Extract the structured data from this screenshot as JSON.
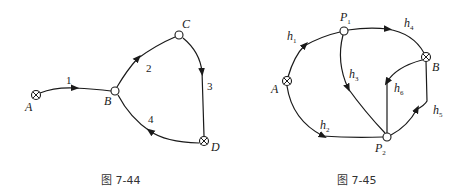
{
  "figures": [
    {
      "caption": "图 7-44",
      "nodes": [
        {
          "id": "A",
          "label": "A",
          "type": "source-sink"
        },
        {
          "id": "B",
          "label": "B",
          "type": "junction"
        },
        {
          "id": "C",
          "label": "C",
          "type": "junction"
        },
        {
          "id": "D",
          "label": "D",
          "type": "source-sink"
        }
      ],
      "edges": [
        {
          "label": "1",
          "from": "A",
          "to": "B"
        },
        {
          "label": "2",
          "from": "B",
          "to": "C"
        },
        {
          "label": "3",
          "from": "C",
          "to": "D"
        },
        {
          "label": "4",
          "from": "D",
          "to": "B"
        }
      ]
    },
    {
      "caption": "图 7-45",
      "nodes": [
        {
          "id": "A",
          "label": "A",
          "type": "source-sink"
        },
        {
          "id": "P1",
          "label": "P",
          "sub": "1",
          "type": "junction"
        },
        {
          "id": "B",
          "label": "B",
          "type": "source-sink"
        },
        {
          "id": "P2",
          "label": "P",
          "sub": "2",
          "type": "junction"
        }
      ],
      "edges": [
        {
          "label": "h",
          "sub": "1",
          "from": "A",
          "to": "P1"
        },
        {
          "label": "h",
          "sub": "2",
          "from": "A",
          "to": "P2"
        },
        {
          "label": "h",
          "sub": "3",
          "from": "P1",
          "to": "P2"
        },
        {
          "label": "h",
          "sub": "4",
          "from": "P1",
          "to": "B"
        },
        {
          "label": "h",
          "sub": "5",
          "from": "P2",
          "to": "B"
        },
        {
          "label": "h",
          "sub": "6",
          "from": "B",
          "to": "P2"
        }
      ]
    }
  ]
}
